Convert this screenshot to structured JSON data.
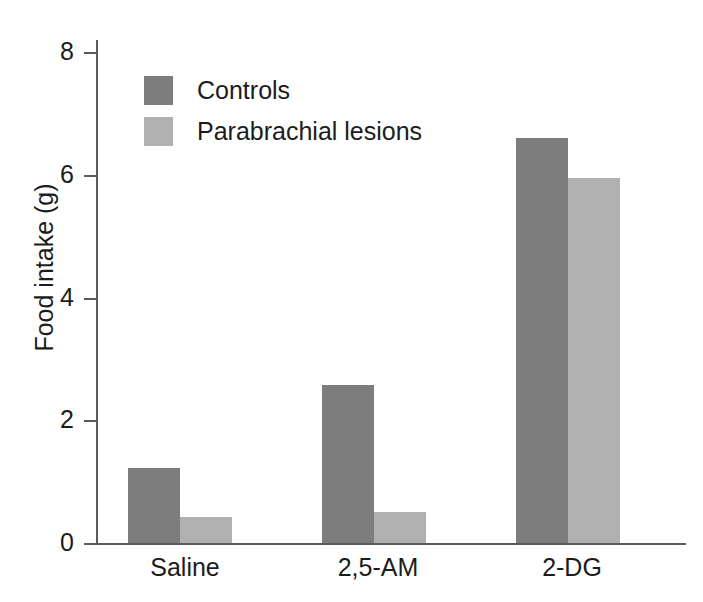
{
  "chart_data": {
    "type": "bar",
    "title": "",
    "xlabel": "",
    "ylabel": "Food intake (g)",
    "categories": [
      "Saline",
      "2,5-AM",
      "2-DG"
    ],
    "series": [
      {
        "name": "Controls",
        "color": "#7d7d7d",
        "values": [
          1.22,
          2.57,
          6.6
        ]
      },
      {
        "name": "Parabrachial lesions",
        "color": "#b0b0b0",
        "values": [
          0.42,
          0.5,
          5.95
        ]
      }
    ],
    "ylim": [
      0,
      8
    ],
    "yticks": [
      "0",
      "2",
      "4",
      "6",
      "8"
    ],
    "ytick_values": [
      0,
      2,
      4,
      6,
      8
    ],
    "grid": false,
    "legend_position": "top-left"
  },
  "axes": {
    "y_title": "Food intake (g)",
    "tick_labels": [
      "8",
      "6",
      "4",
      "2",
      "0"
    ]
  },
  "legend": {
    "entries": [
      {
        "label": "Controls",
        "color": "#7d7d7d"
      },
      {
        "label": "Parabrachial lesions",
        "color": "#b0b0b0"
      }
    ]
  },
  "categories": {
    "items": [
      "Saline",
      "2,5-AM",
      "2-DG"
    ]
  },
  "colors": {
    "controls": "#7d7d7d",
    "lesions": "#b0b0b0",
    "axis": "#5a5a5a",
    "text": "#1c1c1c",
    "background": "#ffffff"
  }
}
